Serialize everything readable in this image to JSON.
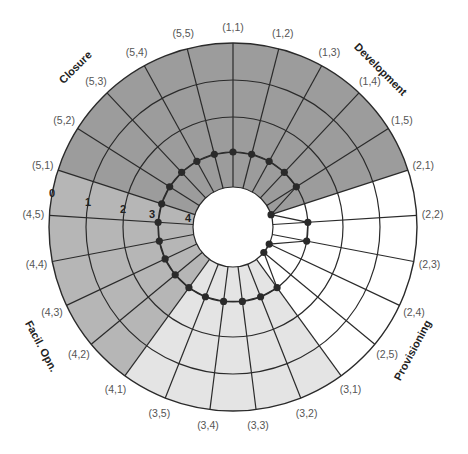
{
  "chart_data": {
    "type": "radial-diagram",
    "title": "",
    "center": [
      233,
      227
    ],
    "outer_radius": 184,
    "ring_radii": [
      184,
      147,
      110,
      75,
      40
    ],
    "ring_labels": [
      "0",
      "1",
      "2",
      "3",
      "4"
    ],
    "phases": [
      {
        "id": 1,
        "name": "Development",
        "color": "#9c9c9c",
        "subsectors": [
          "(1,1)",
          "(1,2)",
          "(1,3)",
          "(1,4)",
          "(1,5)"
        ]
      },
      {
        "id": 2,
        "name": "Provisioning",
        "color": "#ffffff",
        "subsectors": [
          "(2,1)",
          "(2,2)",
          "(2,3)",
          "(2,4)",
          "(2,5)"
        ]
      },
      {
        "id": 3,
        "name": "",
        "color": "#e4e4e4",
        "subsectors": [
          "(3,1)",
          "(3,2)",
          "(3,3)",
          "(3,4)",
          "(3,5)"
        ]
      },
      {
        "id": 4,
        "name": "Facil. Opn.",
        "color": "#b6b6b6",
        "subsectors": [
          "(4,1)",
          "(4,2)",
          "(4,3)",
          "(4,4)",
          "(4,5)"
        ]
      },
      {
        "id": 5,
        "name": "Closure",
        "color": "#9c9c9c",
        "subsectors": [
          "(5,1)",
          "(5,2)",
          "(5,3)",
          "(5,4)",
          "(5,5)"
        ]
      }
    ],
    "spoke_levels": [
      3,
      3,
      3,
      3,
      3,
      4,
      3,
      3,
      4,
      4,
      3,
      3,
      3,
      3,
      3,
      3,
      3,
      3,
      3,
      3,
      3,
      3,
      3,
      3,
      3
    ],
    "phase_label_positions": [
      {
        "name": "Development",
        "x": 378,
        "y": 72,
        "rotate": 45
      },
      {
        "name": "Provisioning",
        "x": 416,
        "y": 352,
        "rotate": -62
      },
      {
        "name": "Facil. Opn.",
        "x": 38,
        "y": 348,
        "rotate": 62
      },
      {
        "name": "Closure",
        "x": 78,
        "y": 70,
        "rotate": -45
      }
    ],
    "ring_label_positions": [
      {
        "label": "0",
        "x": 52,
        "y": 197
      },
      {
        "label": "1",
        "x": 88,
        "y": 206
      },
      {
        "label": "2",
        "x": 123,
        "y": 213
      },
      {
        "label": "3",
        "x": 152,
        "y": 218
      },
      {
        "label": "4",
        "x": 188,
        "y": 222
      }
    ]
  }
}
